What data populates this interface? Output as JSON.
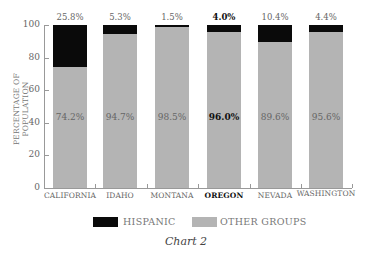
{
  "chart_data": {
    "type": "bar",
    "stacked": true,
    "title": "Chart 2",
    "xlabel": "",
    "ylabel": "PERCENTAGE OF POPULATION",
    "ylim": [
      0,
      100
    ],
    "yticks": [
      "0",
      "20",
      "40",
      "60",
      "80",
      "100"
    ],
    "categories": [
      "CALIFORNIA",
      "IDAHO",
      "MONTANA",
      "OREGON",
      "NEVADA",
      "WASHINGTON"
    ],
    "highlighted_category": "OREGON",
    "series": [
      {
        "name": "HISPANIC",
        "color": "#0a0a0a",
        "values": [
          25.8,
          5.3,
          1.5,
          4.0,
          10.4,
          4.4
        ],
        "labels": [
          "25.8%",
          "5.3%",
          "1.5%",
          "4.0%",
          "10.4%",
          "4.4%"
        ]
      },
      {
        "name": "OTHER GROUPS",
        "color": "#b4b4b4",
        "values": [
          74.2,
          94.7,
          98.5,
          96.0,
          89.6,
          95.6
        ],
        "labels": [
          "74.2%",
          "94.7%",
          "98.5%",
          "96.0%",
          "89.6%",
          "95.6%"
        ]
      }
    ],
    "legend": {
      "position": "bottom",
      "entries": [
        "HISPANIC",
        "OTHER GROUPS"
      ]
    },
    "grid": false
  },
  "caption": "Chart 2"
}
